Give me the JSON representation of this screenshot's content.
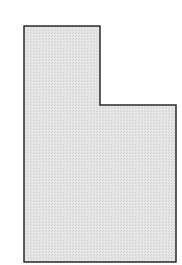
{
  "map": {
    "region_name": "Utah",
    "shape": "L-shaped state outline",
    "fill_color": "#e3e3e3",
    "stroke_color": "#2a2a2a",
    "stroke_width": 1.5,
    "background_color": "#ffffff",
    "outline_points": [
      [
        24,
        26
      ],
      [
        100,
        26
      ],
      [
        100,
        105
      ],
      [
        176,
        105
      ],
      [
        176,
        262
      ],
      [
        24,
        262
      ]
    ]
  }
}
